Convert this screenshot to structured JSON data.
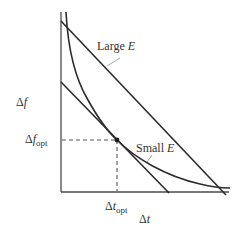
{
  "diagram": {
    "type": "tradeoff-curve",
    "axes": {
      "x_label": "Δt",
      "x_label_var": "t",
      "y_label": "Δf",
      "y_label_var": "f",
      "delta": "Δ"
    },
    "labels": {
      "large_e": {
        "text": "Large ",
        "var": "E"
      },
      "small_e": {
        "text": "Small ",
        "var": "E"
      },
      "f_opt": {
        "delta": "Δ",
        "var": "f",
        "sub": "opt"
      },
      "t_opt": {
        "delta": "Δ",
        "var": "t",
        "sub": "opt"
      }
    },
    "elements": [
      {
        "name": "large-e-line",
        "description": "Straight line (Large E)"
      },
      {
        "name": "small-e-tangent-line",
        "description": "Straight line tangent to curve (Small E)"
      },
      {
        "name": "uncertainty-curve",
        "description": "Hyperbolic curve Δf·Δt = const"
      },
      {
        "name": "optimum-point",
        "description": "Tangent point (Δt_opt, Δf_opt)"
      }
    ],
    "colors": {
      "line": "#2b2b2b",
      "axis": "#4a4a4a",
      "dash": "#555555",
      "text": "#333333",
      "background": "#ffffff"
    }
  }
}
